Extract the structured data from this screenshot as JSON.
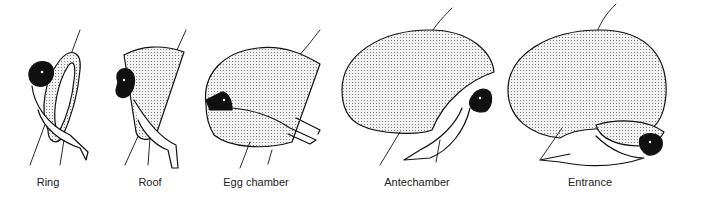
{
  "diagram": {
    "stages": [
      {
        "id": "ring",
        "label": "Ring",
        "label_x": 48
      },
      {
        "id": "roof",
        "label": "Roof",
        "label_x": 150
      },
      {
        "id": "egg-chamber",
        "label": "Egg chamber",
        "label_x": 256
      },
      {
        "id": "antechamber",
        "label": "Antechamber",
        "label_x": 417
      },
      {
        "id": "entrance",
        "label": "Entrance",
        "label_x": 590
      }
    ],
    "colors": {
      "ink": "#111111",
      "fill_dot": "#7a7a7a",
      "background": "#ffffff"
    }
  }
}
